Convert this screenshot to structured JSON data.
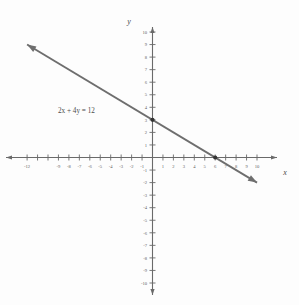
{
  "figure": {
    "background_color": "#fdfdfd",
    "line_color": "#6e6e6e",
    "axis_color": "#6a6a6a",
    "label_color": "#5d5d5d",
    "dot_color": "#333333"
  },
  "axes": {
    "x_label": "x",
    "y_label": "y"
  },
  "annotation": {
    "equation": "2x + 4y = 12"
  },
  "chart_data": {
    "type": "line",
    "title": "",
    "subtitle": "",
    "xlabel": "x",
    "ylabel": "y",
    "xlim": [
      -13,
      11
    ],
    "ylim": [
      -11,
      11
    ],
    "grid": false,
    "legend": "none",
    "annotations": [
      {
        "text": "2x + 4y = 12",
        "x": -7.5,
        "y": 3.9
      }
    ],
    "x_ticks": [
      -12,
      -11,
      -10,
      -9,
      -8,
      -7,
      -6,
      -5,
      -4,
      -3,
      -2,
      -1,
      1,
      2,
      3,
      4,
      5,
      6,
      7,
      8,
      9,
      10
    ],
    "x_tick_labels": [
      "-12",
      "-11",
      "-10",
      "-9",
      "-8",
      "-7",
      "-6",
      "-5",
      "-4",
      "-3",
      "-2",
      "-1",
      "1",
      "2",
      "3",
      "4",
      "5",
      "6",
      "7",
      "8",
      "9",
      "10"
    ],
    "x_labeled_ticks": [
      -12,
      -9,
      -8,
      -7,
      -6,
      -5,
      -4,
      -3,
      -2,
      -1,
      1,
      2,
      3,
      4,
      5,
      6,
      7,
      8,
      9,
      10
    ],
    "y_ticks": [
      -10,
      -9,
      -8,
      -7,
      -6,
      -5,
      -4,
      -3,
      -2,
      -1,
      1,
      2,
      3,
      4,
      5,
      6,
      7,
      8,
      9,
      10
    ],
    "y_tick_labels": [
      "-10",
      "-9",
      "-8",
      "-7",
      "-6",
      "-5",
      "-4",
      "-3",
      "-2",
      "-1",
      "1",
      "2",
      "3",
      "4",
      "5",
      "6",
      "7",
      "8",
      "9",
      "10"
    ],
    "series": [
      {
        "name": "2x + 4y = 12",
        "equation": "2x + 4y = 12",
        "slope": -0.5,
        "y_intercept": 3,
        "x_intercept": 6,
        "x": [
          -12,
          10
        ],
        "y": [
          9,
          -2
        ],
        "arrow_start": true,
        "arrow_end": true,
        "marked_points": [
          {
            "x": 0,
            "y": 3,
            "label": "y-intercept"
          },
          {
            "x": 6,
            "y": 0,
            "label": "x-intercept"
          }
        ]
      }
    ]
  }
}
